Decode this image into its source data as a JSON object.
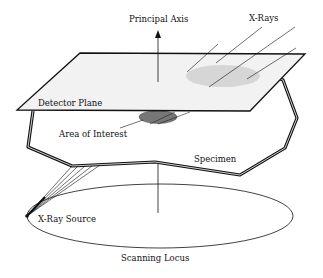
{
  "diagram": {
    "labels": {
      "principal_axis": "Principal Axis",
      "x_rays": "X-Rays",
      "detector_plane": "Detector Plane",
      "area_of_interest": "Area of Interest",
      "specimen": "Specimen",
      "x_ray_source": "X-Ray Source",
      "scanning_locus": "Scanning Locus"
    },
    "colors": {
      "stroke": "#111111",
      "plane_fill": "#f2f2f2",
      "projection_fill": "#d6d6d6",
      "aoi_fill": "#777777"
    }
  }
}
